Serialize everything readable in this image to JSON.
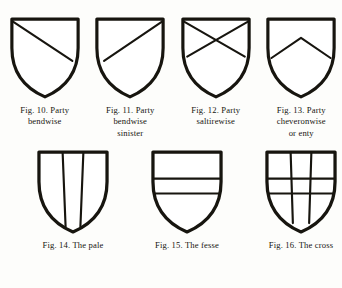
{
  "plate": {
    "background_color": "#fdfdfb",
    "ink_color": "#17150f",
    "rows": [
      {
        "name": "row-top",
        "figures": [
          {
            "id": "fig-10",
            "shield": "party-bendwise",
            "caption_lines": [
              "Fig. 10.  Party",
              "bendwise"
            ],
            "fig_number": "10",
            "term": "Party bendwise"
          },
          {
            "id": "fig-11",
            "shield": "party-bendwise-sinister",
            "caption_lines": [
              "Fig. 11.  Party",
              "bendwise",
              "sinister"
            ],
            "fig_number": "11",
            "term": "Party bendwise sinister"
          },
          {
            "id": "fig-12",
            "shield": "party-saltirewise",
            "caption_lines": [
              "Fig. 12.  Party",
              "saltirewise"
            ],
            "fig_number": "12",
            "term": "Party saltirewise"
          },
          {
            "id": "fig-13",
            "shield": "party-cheveronwise",
            "caption_lines": [
              "Fig. 13.  Party",
              "cheveronwise",
              "or enty"
            ],
            "fig_number": "13",
            "term": "Party cheveronwise or enty"
          }
        ]
      },
      {
        "name": "row-bottom",
        "figures": [
          {
            "id": "fig-14",
            "shield": "the-pale",
            "caption_lines": [
              "Fig. 14.  The pale"
            ],
            "fig_number": "14",
            "term": "The pale"
          },
          {
            "id": "fig-15",
            "shield": "the-fesse",
            "caption_lines": [
              "Fig. 15.  The fesse"
            ],
            "fig_number": "15",
            "term": "The fesse"
          },
          {
            "id": "fig-16",
            "shield": "the-cross",
            "caption_lines": [
              "Fig. 16.  The cross"
            ],
            "fig_number": "16",
            "term": "The cross"
          }
        ]
      }
    ]
  },
  "geometry": {
    "viewbox": "0 0 100 116",
    "shield_path": "M 4 4 L 96 4 L 96 44 C 96 74 82 98 50 112 C 18 98 4 74 4 44 L 4 4 Z",
    "charges": {
      "party-bendwise": [
        "M 5 7 L 88 62"
      ],
      "party-bendwise-sinister": [
        "M 95 7 L 14 62"
      ],
      "party-saltirewise": [
        "M 5 7 L 90 56",
        "M 95 7 L 10 56"
      ],
      "party-cheveronwise": [
        "M 9 58 L 50 30 L 91 58"
      ],
      "the-pale": [
        "M 36 5 L 40 105",
        "M 64 5 L 60 105"
      ],
      "the-fesse": [
        "M 5 40 L 95 40",
        "M 6 60 L 94 60"
      ],
      "the-cross": [
        "M 36 5 L 39 100",
        "M 64 5 L 61 100",
        "M 5 40 L 95 40",
        "M 6 60 L 94 60"
      ]
    },
    "sizes": {
      "row-top": {
        "width": 72,
        "height": 84
      },
      "row-bottom": {
        "width": 74,
        "height": 86
      }
    }
  }
}
